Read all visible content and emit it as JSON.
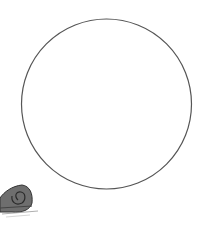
{
  "scene": {
    "background": "#ffffff",
    "circle": {
      "cx": 106.5,
      "cy": 104,
      "r": 85,
      "stroke": "#555555"
    },
    "character": {
      "name": "snail",
      "shell_color": "#6e6e6e",
      "body_color": "#8a8a8a"
    }
  }
}
